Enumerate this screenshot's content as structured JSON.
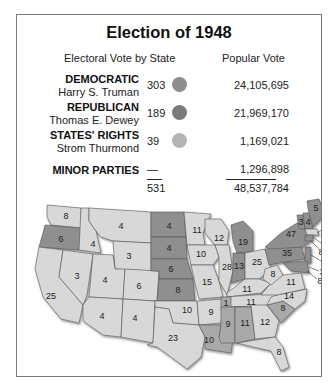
{
  "title": "Election of 1948",
  "headers": {
    "electoral": "Electoral Vote by State",
    "popular": "Popular Vote"
  },
  "colors": {
    "democratic": "#8e8e8e",
    "republican": "#7b7b7b",
    "states_rights": "#b5b5b5",
    "map_democratic": "#d8d8d8",
    "map_republican": "#8f8f8f",
    "map_states_rights": "#a9a9a9",
    "frame": "#7a7a7a"
  },
  "parties": [
    {
      "party": "DEMOCRATIC",
      "candidate": "Harry S. Truman",
      "electoral": "303",
      "popular": "24,105,695",
      "color": "#8e8e8e"
    },
    {
      "party": "REPUBLICAN",
      "candidate": "Thomas E. Dewey",
      "electoral": "189",
      "popular": "21,969,170",
      "color": "#7b7b7b"
    },
    {
      "party": "STATES' RIGHTS",
      "candidate": "Strom Thurmond",
      "electoral": "39",
      "popular": "1,169,021",
      "color": "#b5b5b5"
    },
    {
      "party": "MINOR PARTIES",
      "candidate": "",
      "electoral": "—",
      "popular": "1,296,898"
    }
  ],
  "totals": {
    "electoral": "531",
    "popular": "48,537,784"
  },
  "map": {
    "states": [
      {
        "name": "Washington",
        "votes": "8",
        "winner": "D"
      },
      {
        "name": "Oregon",
        "votes": "6",
        "winner": "R"
      },
      {
        "name": "California",
        "votes": "25",
        "winner": "D"
      },
      {
        "name": "Idaho",
        "votes": "4",
        "winner": "D"
      },
      {
        "name": "Nevada",
        "votes": "3",
        "winner": "D"
      },
      {
        "name": "Montana",
        "votes": "4",
        "winner": "D"
      },
      {
        "name": "Wyoming",
        "votes": "3",
        "winner": "D"
      },
      {
        "name": "Utah",
        "votes": "4",
        "winner": "D"
      },
      {
        "name": "Colorado",
        "votes": "6",
        "winner": "D"
      },
      {
        "name": "Arizona",
        "votes": "4",
        "winner": "D"
      },
      {
        "name": "New Mexico",
        "votes": "4",
        "winner": "D"
      },
      {
        "name": "North Dakota",
        "votes": "4",
        "winner": "R"
      },
      {
        "name": "South Dakota",
        "votes": "4",
        "winner": "R"
      },
      {
        "name": "Nebraska",
        "votes": "6",
        "winner": "R"
      },
      {
        "name": "Kansas",
        "votes": "8",
        "winner": "R"
      },
      {
        "name": "Oklahoma",
        "votes": "10",
        "winner": "D"
      },
      {
        "name": "Texas",
        "votes": "23",
        "winner": "D"
      },
      {
        "name": "Minnesota",
        "votes": "11",
        "winner": "D"
      },
      {
        "name": "Iowa",
        "votes": "10",
        "winner": "D"
      },
      {
        "name": "Missouri",
        "votes": "15",
        "winner": "D"
      },
      {
        "name": "Arkansas",
        "votes": "9",
        "winner": "D"
      },
      {
        "name": "Louisiana",
        "votes": "10",
        "winner": "SR"
      },
      {
        "name": "Wisconsin",
        "votes": "12",
        "winner": "D"
      },
      {
        "name": "Illinois",
        "votes": "28",
        "winner": "D"
      },
      {
        "name": "Michigan",
        "votes": "19",
        "winner": "R"
      },
      {
        "name": "Indiana",
        "votes": "13",
        "winner": "R"
      },
      {
        "name": "Ohio",
        "votes": "25",
        "winner": "D"
      },
      {
        "name": "Kentucky",
        "votes": "11",
        "winner": "D"
      },
      {
        "name": "Tennessee",
        "votes": "11",
        "winner": "D"
      },
      {
        "name": "Tennessee (Thurmond)",
        "votes": "1",
        "winner": "SR"
      },
      {
        "name": "Mississippi",
        "votes": "9",
        "winner": "SR"
      },
      {
        "name": "Alabama",
        "votes": "11",
        "winner": "SR"
      },
      {
        "name": "Georgia",
        "votes": "12",
        "winner": "D"
      },
      {
        "name": "Florida",
        "votes": "8",
        "winner": "D"
      },
      {
        "name": "South Carolina",
        "votes": "8",
        "winner": "SR"
      },
      {
        "name": "North Carolina",
        "votes": "14",
        "winner": "D"
      },
      {
        "name": "Virginia",
        "votes": "11",
        "winner": "D"
      },
      {
        "name": "West Virginia",
        "votes": "8",
        "winner": "D"
      },
      {
        "name": "Pennsylvania",
        "votes": "35",
        "winner": "R"
      },
      {
        "name": "New York",
        "votes": "47",
        "winner": "R"
      },
      {
        "name": "Vermont",
        "votes": "3",
        "winner": "R"
      },
      {
        "name": "New Hampshire",
        "votes": "4",
        "winner": "R"
      },
      {
        "name": "Maine",
        "votes": "5",
        "winner": "R"
      },
      {
        "name": "Massachusetts",
        "votes": "16",
        "winner": "D"
      },
      {
        "name": "Rhode Island",
        "votes": "4",
        "winner": "D"
      },
      {
        "name": "Connecticut",
        "votes": "8",
        "winner": "R"
      },
      {
        "name": "New Jersey",
        "votes": "16",
        "winner": "R"
      },
      {
        "name": "Delaware",
        "votes": "3",
        "winner": "R"
      },
      {
        "name": "Maryland",
        "votes": "8",
        "winner": "R"
      }
    ]
  }
}
